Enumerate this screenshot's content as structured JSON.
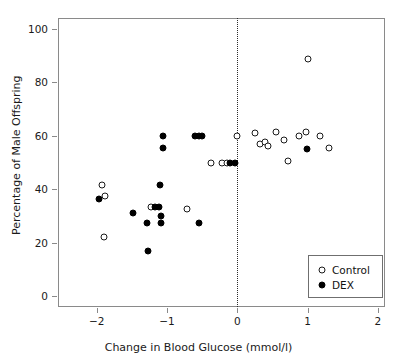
{
  "chart_data": {
    "type": "scatter",
    "title": "",
    "xlabel": "Change in Blood Glucose (mmol/l)",
    "ylabel": "Percentage of Male Offspring",
    "xlim": [
      -2.55,
      2.1
    ],
    "ylim": [
      -4,
      104
    ],
    "xticks": [
      -2,
      -1,
      0,
      1,
      2
    ],
    "xtick_labels": [
      "−2",
      "−1",
      "0",
      "1",
      "2"
    ],
    "yticks": [
      0,
      20,
      40,
      60,
      80,
      100
    ],
    "ytick_labels": [
      "0",
      "20",
      "40",
      "60",
      "80",
      "100"
    ],
    "grid": false,
    "annotations": [
      {
        "type": "vline",
        "x": 0,
        "style": "dotted"
      }
    ],
    "legend": {
      "position": "bottom-right",
      "entries": [
        {
          "name": "Control",
          "marker": "open-circle",
          "color": "#000000"
        },
        {
          "name": "DEX",
          "marker": "filled-circle",
          "color": "#000000"
        }
      ]
    },
    "series": [
      {
        "name": "Control",
        "marker": "open-circle",
        "points": [
          [
            -1.93,
            41.5
          ],
          [
            -1.88,
            37.5
          ],
          [
            -1.9,
            22.0
          ],
          [
            -1.23,
            33.5
          ],
          [
            -0.72,
            32.5
          ],
          [
            -0.38,
            50.0
          ],
          [
            -0.22,
            50.0
          ],
          [
            -0.15,
            50.0
          ],
          [
            0.0,
            60.0
          ],
          [
            0.25,
            61.0
          ],
          [
            0.32,
            57.0
          ],
          [
            0.39,
            57.5
          ],
          [
            0.44,
            56.0
          ],
          [
            0.55,
            61.5
          ],
          [
            0.67,
            58.5
          ],
          [
            0.72,
            50.5
          ],
          [
            0.88,
            60.0
          ],
          [
            0.98,
            61.5
          ],
          [
            1.0,
            88.5
          ],
          [
            1.17,
            60.0
          ],
          [
            1.3,
            55.5
          ]
        ]
      },
      {
        "name": "DEX",
        "marker": "filled-circle",
        "points": [
          [
            -1.97,
            36.5
          ],
          [
            -1.48,
            31.0
          ],
          [
            -1.28,
            27.5
          ],
          [
            -1.27,
            16.8
          ],
          [
            -1.17,
            33.5
          ],
          [
            -1.12,
            33.5
          ],
          [
            -1.1,
            41.5
          ],
          [
            -1.09,
            30.0
          ],
          [
            -1.08,
            27.5
          ],
          [
            -1.05,
            60.0
          ],
          [
            -1.05,
            55.5
          ],
          [
            -0.6,
            60.0
          ],
          [
            -0.55,
            60.0
          ],
          [
            -0.5,
            60.0
          ],
          [
            -0.55,
            27.5
          ],
          [
            -0.1,
            50.0
          ],
          [
            -0.04,
            50.0
          ],
          [
            0.99,
            55.0
          ]
        ]
      }
    ]
  },
  "axes": {
    "x_axis_name": "x-axis",
    "y_axis_name": "y-axis"
  }
}
